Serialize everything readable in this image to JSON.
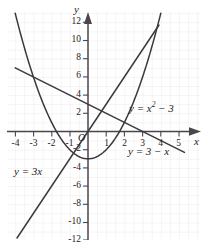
{
  "figure": {
    "kind": "cartesian-graph",
    "origin_label": "O",
    "background": "#ffffff",
    "grid_color": "#e2e2e6",
    "curve_color": "#3a3a3e",
    "axis_color": "#4a474c",
    "text_color": "#262226"
  },
  "axes": {
    "x_name": "x",
    "y_name": "y",
    "x_ticks": [
      "-4",
      "-3",
      "-2",
      "-1",
      "1",
      "2",
      "3",
      "4",
      "5"
    ],
    "y_ticks": [
      "12",
      "10",
      "8",
      "6",
      "4",
      "2",
      "-2",
      "-4",
      "-6",
      "-8",
      "-10",
      "-12"
    ]
  },
  "labels": {
    "parabola": {
      "lhs": "y = x",
      "exp": "2",
      "rhs": "− 3"
    },
    "line_decreasing": "y = 3 − x",
    "line_increasing": "y = 3x"
  },
  "chart_data": {
    "type": "line",
    "title": "",
    "xlabel": "x",
    "ylabel": "y",
    "xlim": [
      -4.6,
      5.6
    ],
    "ylim": [
      -12.8,
      12.8
    ],
    "grid": true,
    "grid_step": 0.5,
    "legend": "inline-annotations",
    "series": [
      {
        "name": "y = x^2 - 3",
        "equation": "y = x^2 - 3",
        "type": "parabola",
        "vertex": [
          0,
          -3
        ],
        "x": [
          -4.0,
          -3.5,
          -3.0,
          -2.5,
          -2.0,
          -1.5,
          -1.0,
          -0.5,
          0.0,
          0.5,
          1.0,
          1.5,
          2.0,
          2.5,
          3.0,
          3.5,
          3.84
        ],
        "y": [
          13.0,
          9.25,
          6.0,
          3.25,
          1.0,
          -0.75,
          -2.0,
          -2.75,
          -3.0,
          -2.75,
          -2.0,
          -0.75,
          1.0,
          3.25,
          6.0,
          9.25,
          11.75
        ]
      },
      {
        "name": "y = 3 - x",
        "equation": "y = 3 - x",
        "type": "line",
        "slope": -1,
        "intercept": 3,
        "x": [
          -4.0,
          5.3
        ],
        "y": [
          7.0,
          -2.3
        ]
      },
      {
        "name": "y = 3x",
        "equation": "y = 3x",
        "type": "line",
        "slope": 3,
        "intercept": 0,
        "x": [
          -3.9,
          3.9
        ],
        "y": [
          -11.7,
          11.7
        ]
      }
    ],
    "intersections": [
      {
        "of": [
          "y = x^2 - 3",
          "y = 3 - x"
        ],
        "point": [
          -3,
          6
        ]
      },
      {
        "of": [
          "y = x^2 - 3",
          "y = 3 - x"
        ],
        "point": [
          2,
          1
        ]
      },
      {
        "of": [
          "y = x^2 - 3",
          "y = 3x"
        ],
        "point": [
          -0.79,
          -2.37
        ]
      },
      {
        "of": [
          "y = x^2 - 3",
          "y = 3x"
        ],
        "point": [
          3.79,
          11.37
        ]
      },
      {
        "of": [
          "y = 3 - x",
          "y = 3x"
        ],
        "point": [
          0.75,
          2.25
        ]
      }
    ]
  }
}
